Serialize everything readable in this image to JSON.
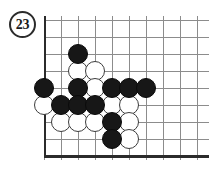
{
  "figure": {
    "number": "23",
    "badge_name": "figure-number-badge"
  },
  "board": {
    "type": "go-board-diagram",
    "cell_size": 17,
    "cols": 10,
    "rows": 9,
    "origin_x": 0,
    "origin_y": 4,
    "stone_radius": 10,
    "edges": {
      "left": "thick",
      "bottom": "thick",
      "top": "open",
      "right": "open"
    },
    "colors": {
      "grid_line": "#8c8c8c",
      "border_line": "#2b2b2b",
      "black_stone": "#171717",
      "white_stone": "#ffffff",
      "white_stone_outline": "#3c3c3c",
      "background": "#ffffff"
    },
    "stones": [
      {
        "col": 2,
        "row": 2,
        "color": "black"
      },
      {
        "col": 2,
        "row": 3,
        "color": "white"
      },
      {
        "col": 3,
        "row": 3,
        "color": "white"
      },
      {
        "col": 0,
        "row": 4,
        "color": "black"
      },
      {
        "col": 2,
        "row": 4,
        "color": "black"
      },
      {
        "col": 3,
        "row": 4,
        "color": "white"
      },
      {
        "col": 4,
        "row": 4,
        "color": "black"
      },
      {
        "col": 5,
        "row": 4,
        "color": "black"
      },
      {
        "col": 6,
        "row": 4,
        "color": "black"
      },
      {
        "col": 0,
        "row": 5,
        "color": "white"
      },
      {
        "col": 1,
        "row": 5,
        "color": "black"
      },
      {
        "col": 2,
        "row": 5,
        "color": "black"
      },
      {
        "col": 3,
        "row": 5,
        "color": "black"
      },
      {
        "col": 4,
        "row": 5,
        "color": "white"
      },
      {
        "col": 5,
        "row": 5,
        "color": "white"
      },
      {
        "col": 1,
        "row": 6,
        "color": "white"
      },
      {
        "col": 2,
        "row": 6,
        "color": "white"
      },
      {
        "col": 3,
        "row": 6,
        "color": "white"
      },
      {
        "col": 4,
        "row": 6,
        "color": "black"
      },
      {
        "col": 5,
        "row": 6,
        "color": "white"
      },
      {
        "col": 4,
        "row": 7,
        "color": "black"
      },
      {
        "col": 5,
        "row": 7,
        "color": "white"
      }
    ]
  }
}
